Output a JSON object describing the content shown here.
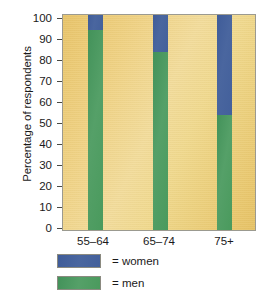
{
  "chart_data": {
    "type": "bar",
    "variant": "stacked-100-percent",
    "title": "",
    "xlabel": "",
    "ylabel": "Percentage of respondents",
    "categories": [
      "55–64",
      "65–74",
      "75+"
    ],
    "series": [
      {
        "name": "women",
        "color": "#47639e",
        "values": [
          8,
          18,
          47
        ]
      },
      {
        "name": "men",
        "color": "#4a9a5a",
        "values": [
          92,
          82,
          53
        ]
      }
    ],
    "stack_order": [
      "men",
      "women"
    ],
    "ylim": [
      0,
      100
    ],
    "ytick_labels": [
      "100",
      "90",
      "80",
      "70",
      "60",
      "50",
      "40",
      "30",
      "20",
      "10",
      "0"
    ],
    "ytick_values": [
      100,
      90,
      80,
      70,
      60,
      50,
      40,
      30,
      20,
      10,
      0
    ],
    "grid": false,
    "legend_position": "bottom-left",
    "legend_entries": [
      {
        "label": "= women",
        "color": "#47639e"
      },
      {
        "label": "= men",
        "color": "#4a9a5a"
      }
    ],
    "plot_background_color": "#eed38a",
    "frame_color": "#9b9a90"
  }
}
